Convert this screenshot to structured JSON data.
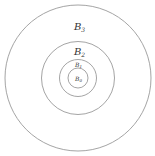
{
  "diagram": {
    "type": "concentric-circles",
    "center": [
      78,
      78
    ],
    "circles": [
      {
        "name": "B3",
        "label_main": "B",
        "label_sub": "3",
        "radius": 73
      },
      {
        "name": "B2",
        "label_main": "B",
        "label_sub": "2",
        "radius": 36
      },
      {
        "name": "B1",
        "label_main": "B",
        "label_sub": "1",
        "radius": 18
      },
      {
        "name": "B0",
        "label_main": "B",
        "label_sub": "0",
        "radius": 10
      }
    ],
    "stroke_color": "#9a9a9a",
    "label_color": "#333333"
  }
}
